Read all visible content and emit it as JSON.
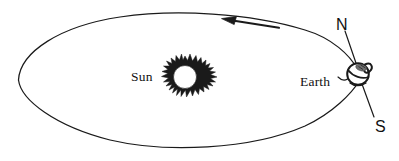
{
  "figure": {
    "background_color": "#ffffff",
    "ink_color": "#1a1a1a",
    "width": 399,
    "height": 161
  },
  "labels": {
    "sun": "Sun",
    "earth": "Earth",
    "north_pole": "N",
    "south_pole": "S"
  },
  "bodies": {
    "sun": {
      "name": "Sun",
      "center_x": 185,
      "center_y": 78,
      "core_radius": 11,
      "corona_radius": 22,
      "style": "spiky-corona"
    },
    "earth": {
      "name": "Earth",
      "center_x": 358,
      "center_y": 74,
      "radius": 11,
      "style": "sketched-globe"
    }
  },
  "orbit": {
    "shape": "elongated-lens-ellipse",
    "left_apex_x": 18,
    "left_apex_y": 80,
    "right_apex_x": 360,
    "right_apex_y": 75,
    "top_y": 12,
    "bottom_y": 147,
    "stroke_width": 1.2
  },
  "axis": {
    "name": "rotation-axis",
    "north_x": 344,
    "north_y": 32,
    "south_x": 373,
    "south_y": 118,
    "tilt_description": "tilted axis through Earth from N to S"
  },
  "direction_arrow": {
    "name": "orbital-direction-arrow",
    "points": "left",
    "tail_x": 278,
    "tail_y": 27,
    "head_x": 222,
    "head_y": 19,
    "meaning": "direction of Earth's orbital motion"
  },
  "icons": {
    "sun_icon": "sun-icon",
    "earth_icon": "earth-globe-icon",
    "arrow_icon": "arrow-left-icon"
  }
}
